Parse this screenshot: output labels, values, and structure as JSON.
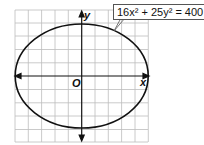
{
  "diagram": {
    "type": "ellipse-graph",
    "equation_label": "16x² + 25y² = 400",
    "axes": {
      "x_label": "x",
      "y_label": "y",
      "origin_label": "O"
    },
    "ellipse": {
      "a": 5,
      "b": 4,
      "center": [
        0,
        0
      ]
    },
    "grid": {
      "x_range": [
        -5,
        5
      ],
      "y_range": [
        -5,
        5
      ],
      "step": 1
    },
    "colors": {
      "grid": "#b8b8b8",
      "curve": "#111111",
      "axes": "#111111"
    }
  }
}
